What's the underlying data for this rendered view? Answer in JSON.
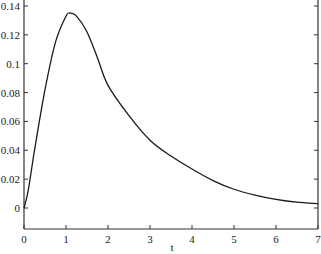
{
  "chart_data": {
    "type": "line",
    "title": "",
    "xlabel": "t",
    "ylabel": "",
    "xlim": [
      0,
      7
    ],
    "ylim": [
      -0.015,
      0.145
    ],
    "grid": false,
    "legend": null,
    "x_ticks": [
      "0",
      "1",
      "2",
      "3",
      "4",
      "5",
      "6",
      "7"
    ],
    "y_ticks": [
      "0",
      "0.02",
      "0.04",
      "0.06",
      "0.08",
      "0.1",
      "0.12",
      "0.14"
    ],
    "series": [
      {
        "name": "f(t)",
        "color": "#1a1a1a",
        "x": [
          0,
          0.1,
          0.25,
          0.5,
          0.75,
          1.0,
          1.1,
          1.25,
          1.5,
          1.75,
          2.0,
          2.5,
          3.0,
          3.5,
          4.0,
          4.5,
          5.0,
          5.5,
          6.0,
          6.5,
          7.0
        ],
        "values": [
          0,
          0.012,
          0.04,
          0.082,
          0.115,
          0.133,
          0.135,
          0.133,
          0.122,
          0.104,
          0.085,
          0.064,
          0.047,
          0.036,
          0.027,
          0.019,
          0.013,
          0.009,
          0.006,
          0.004,
          0.003
        ]
      }
    ]
  }
}
